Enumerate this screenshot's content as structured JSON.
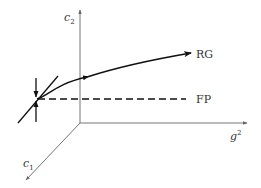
{
  "diagram": {
    "type": "rg-flow-3d-axes",
    "axes": {
      "vertical": {
        "label": "c",
        "subscript": "2"
      },
      "horizontal": {
        "label": "g",
        "superscript": "2"
      },
      "depth": {
        "label": "c",
        "subscript": "1"
      }
    },
    "curves": {
      "rg": {
        "label": "RG",
        "style": "solid-arrow"
      },
      "fp": {
        "label": "FP",
        "style": "dashed"
      }
    },
    "fixed_point": {
      "name": "fixed-point",
      "directions": [
        "vertical",
        "diagonal"
      ]
    },
    "colors": {
      "axis": "#777777",
      "curve": "#111111",
      "text": "#333333",
      "background": "#ffffff"
    }
  }
}
